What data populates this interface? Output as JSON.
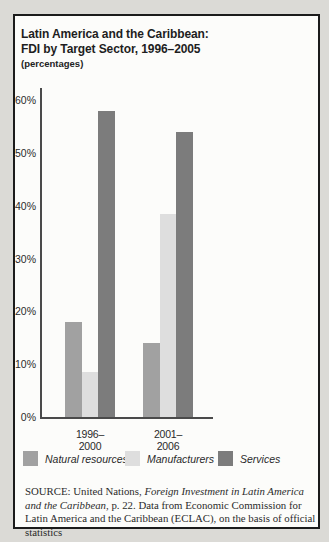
{
  "header": {
    "title_line1": "Latin America and the Caribbean:",
    "title_line2": "FDI by Target Sector, 1996–2005",
    "subtitle": "(percentages)"
  },
  "chart_data": {
    "type": "bar",
    "categories": [
      "1996–2000",
      "2001–2006"
    ],
    "series": [
      {
        "name": "Natural resources",
        "color": "#a1a1a1",
        "values": [
          18,
          14
        ]
      },
      {
        "name": "Manufacturers",
        "color": "#dedede",
        "values": [
          8.5,
          38.5
        ]
      },
      {
        "name": "Services",
        "color": "#7c7c7c",
        "values": [
          58,
          54
        ]
      }
    ],
    "title": "Latin America and the Caribbean: FDI by Target Sector, 1996–2005",
    "xlabel": "",
    "ylabel": "percentages",
    "ymin": 0,
    "ymax": 60,
    "ytick_labels": [
      "0%",
      "10%",
      "20%",
      "30%",
      "40%",
      "50%",
      "60%"
    ],
    "grid": false,
    "legend_position": "bottom"
  },
  "source": {
    "segments": [
      {
        "text": "SOURCE: United Nations, ",
        "italic": false
      },
      {
        "text": "Foreign Investment in Latin America and the Caribbean",
        "italic": true
      },
      {
        "text": ", p. 22. Data from Economic Commission for Latin America and the Caribbean (ECLAC), on the basis of official statistics",
        "italic": false
      }
    ]
  }
}
